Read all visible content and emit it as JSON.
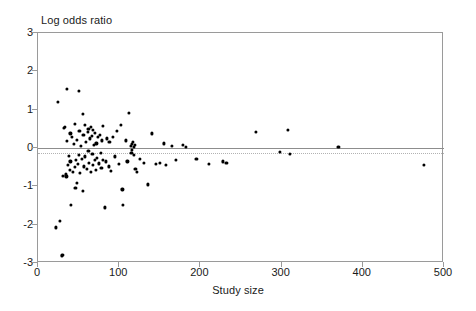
{
  "chart_data": {
    "type": "scatter",
    "title": "",
    "ylabel": "Log odds ratio",
    "xlabel": "Study size",
    "xlim": [
      0,
      500
    ],
    "ylim": [
      -3,
      3
    ],
    "xticks": [
      0,
      100,
      200,
      300,
      400,
      500
    ],
    "yticks": [
      3,
      2,
      1,
      0,
      -1,
      -2,
      -3
    ],
    "grid": false,
    "legend": null,
    "marker_color": "#000000",
    "frame_color": "#9a9a9a",
    "reference_lines": [
      {
        "name": "null-effect-line",
        "y": 0,
        "style": "solid",
        "color": "#8d8d8d"
      },
      {
        "name": "pooled-estimate-line",
        "y": -0.13,
        "style": "dotted",
        "color": "#b2b2b2"
      }
    ],
    "points": [
      [
        22,
        -2.07
      ],
      [
        25,
        1.21
      ],
      [
        27,
        -1.9
      ],
      [
        29,
        -2.82
      ],
      [
        30,
        -2.78
      ],
      [
        31,
        -0.72
      ],
      [
        32,
        0.52
      ],
      [
        33,
        0.55
      ],
      [
        34,
        -0.69
      ],
      [
        35,
        -0.74
      ],
      [
        36,
        1.55
      ],
      [
        36,
        0.18
      ],
      [
        37,
        -0.45
      ],
      [
        38,
        -0.2
      ],
      [
        39,
        -0.58
      ],
      [
        40,
        0.38
      ],
      [
        40,
        -0.35
      ],
      [
        41,
        -1.48
      ],
      [
        42,
        0.3
      ],
      [
        43,
        -0.62
      ],
      [
        44,
        0.1
      ],
      [
        45,
        -0.5
      ],
      [
        45,
        0.62
      ],
      [
        46,
        -1.05
      ],
      [
        47,
        -0.32
      ],
      [
        48,
        0.22
      ],
      [
        48,
        -0.9
      ],
      [
        49,
        -0.42
      ],
      [
        50,
        1.48
      ],
      [
        50,
        -0.18
      ],
      [
        51,
        0.45
      ],
      [
        52,
        -0.65
      ],
      [
        53,
        0.05
      ],
      [
        54,
        -0.28
      ],
      [
        55,
        0.88
      ],
      [
        55,
        -1.12
      ],
      [
        56,
        0.35
      ],
      [
        57,
        -0.48
      ],
      [
        58,
        0.6
      ],
      [
        58,
        -0.22
      ],
      [
        59,
        0.15
      ],
      [
        60,
        -0.55
      ],
      [
        61,
        0.42
      ],
      [
        62,
        -0.08
      ],
      [
        62,
        0.5
      ],
      [
        63,
        -0.38
      ],
      [
        64,
        0.25
      ],
      [
        65,
        0.55
      ],
      [
        65,
        -0.62
      ],
      [
        66,
        0.32
      ],
      [
        67,
        -0.15
      ],
      [
        68,
        0.48
      ],
      [
        68,
        -0.45
      ],
      [
        69,
        0.08
      ],
      [
        70,
        -0.3
      ],
      [
        70,
        0.4
      ],
      [
        71,
        -0.58
      ],
      [
        72,
        0.12
      ],
      [
        73,
        -0.25
      ],
      [
        74,
        0.28
      ],
      [
        75,
        -0.4
      ],
      [
        76,
        0.35
      ],
      [
        77,
        -0.12
      ],
      [
        78,
        -0.52
      ],
      [
        79,
        0.2
      ],
      [
        80,
        -0.3
      ],
      [
        80,
        0.58
      ],
      [
        82,
        -1.55
      ],
      [
        84,
        -0.35
      ],
      [
        85,
        0.25
      ],
      [
        87,
        -0.48
      ],
      [
        88,
        0.15
      ],
      [
        90,
        -0.6
      ],
      [
        92,
        0.3
      ],
      [
        95,
        -0.22
      ],
      [
        97,
        0.45
      ],
      [
        100,
        -0.42
      ],
      [
        102,
        0.6
      ],
      [
        104,
        -1.08
      ],
      [
        105,
        -1.48
      ],
      [
        108,
        0.2
      ],
      [
        110,
        -0.35
      ],
      [
        112,
        0.92
      ],
      [
        114,
        0.05
      ],
      [
        115,
        -0.12
      ],
      [
        116,
        0.1
      ],
      [
        116,
        -0.05
      ],
      [
        117,
        0.15
      ],
      [
        118,
        0.02
      ],
      [
        118,
        -0.18
      ],
      [
        119,
        0.08
      ],
      [
        120,
        -0.55
      ],
      [
        122,
        -0.62
      ],
      [
        125,
        -0.28
      ],
      [
        130,
        -0.38
      ],
      [
        135,
        -0.95
      ],
      [
        140,
        0.38
      ],
      [
        145,
        -0.42
      ],
      [
        150,
        -0.38
      ],
      [
        155,
        0.12
      ],
      [
        158,
        -0.45
      ],
      [
        165,
        0.05
      ],
      [
        170,
        -0.3
      ],
      [
        178,
        0.08
      ],
      [
        182,
        0.02
      ],
      [
        195,
        -0.28
      ],
      [
        210,
        -0.42
      ],
      [
        228,
        -0.35
      ],
      [
        232,
        -0.38
      ],
      [
        268,
        0.42
      ],
      [
        298,
        -0.1
      ],
      [
        308,
        0.48
      ],
      [
        310,
        -0.15
      ],
      [
        370,
        0.02
      ],
      [
        475,
        -0.45
      ]
    ]
  },
  "axis": {
    "y_title": "Log odds ratio",
    "x_title": "Study size",
    "y_tick_labels": [
      "3",
      "2",
      "1",
      "0",
      "-1",
      "-2",
      "-3"
    ],
    "x_tick_labels": [
      "0",
      "100",
      "200",
      "300",
      "400",
      "500"
    ]
  }
}
